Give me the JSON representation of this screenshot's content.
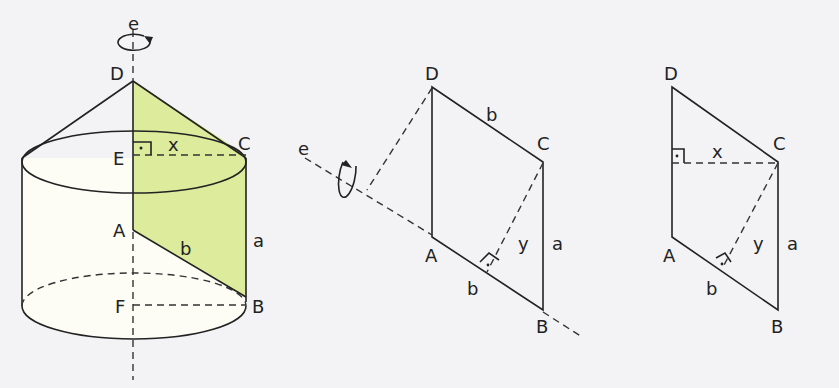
{
  "figures": [
    {
      "name": "cylinder-with-cone",
      "labels": {
        "axis": "e",
        "D": "D",
        "C": "C",
        "E": "E",
        "x": "x",
        "A": "A",
        "b": "b",
        "a": "a",
        "F": "F",
        "B": "B"
      }
    },
    {
      "name": "parallelogram-rotation",
      "labels": {
        "axis": "e",
        "D": "D",
        "b_top": "b",
        "C": "C",
        "A": "A",
        "y": "y",
        "a": "a",
        "b_bottom": "b",
        "B": "B"
      }
    },
    {
      "name": "parallelogram-heights",
      "labels": {
        "D": "D",
        "x": "x",
        "C": "C",
        "A": "A",
        "y": "y",
        "a": "a",
        "b": "b",
        "B": "B"
      }
    }
  ],
  "colors": {
    "highlight": "#dcec9c",
    "panel": "#fdfde9",
    "stroke": "#222222"
  }
}
